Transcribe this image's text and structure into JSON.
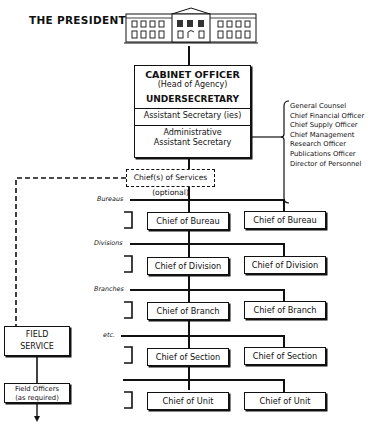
{
  "header": {
    "president_label": "THE PRESIDENT",
    "icon": "white-house-icon"
  },
  "cabinet": {
    "title": "CABINET OFFICER",
    "subtitle": "(Head of Agency)",
    "undersecretary": "UNDERSECRETARY",
    "assistant": "Assistant Secretary (ies)",
    "admin_line1": "Administrative",
    "admin_line2": "Assistant Secretary"
  },
  "staff_offices": [
    "General Counsel",
    "Chief Financial Officer",
    "Chief Supply Officer",
    "Chief Management",
    "Research Officer",
    "Publications Officer",
    "Director of Personnel"
  ],
  "services": {
    "label": "Chief(s) of Services (optional)"
  },
  "levels": [
    {
      "label": "Bureaus",
      "chief_left": "Chief of Bureau",
      "chief_right": "Chief of Bureau"
    },
    {
      "label": "Divisions",
      "chief_left": "Chief of Division",
      "chief_right": "Chief of Division"
    },
    {
      "label": "Branches",
      "chief_left": "Chief of Branch",
      "chief_right": "Chief of Branch"
    },
    {
      "label": "etc.",
      "chief_left": "Chief of Section",
      "chief_right": "Chief of Section"
    },
    {
      "label": "",
      "chief_left": "Chief of Unit",
      "chief_right": "Chief of Unit"
    }
  ],
  "field": {
    "service_line1": "FIELD",
    "service_line2": "SERVICE",
    "officers_line1": "Field Officers",
    "officers_line2": "(as required)"
  }
}
